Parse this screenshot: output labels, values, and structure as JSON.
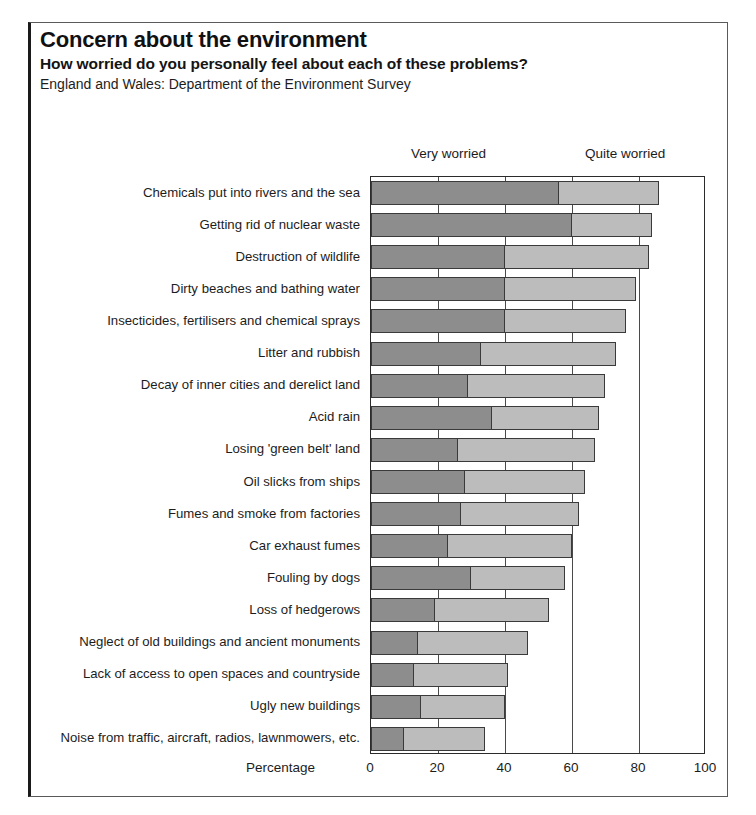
{
  "header": {
    "title": "Concern about the environment",
    "subtitle": "How worried do you personally feel about each of these problems?",
    "source": "England and Wales: Department of the Environment Survey"
  },
  "legend": {
    "very": "Very worried",
    "quite": "Quite worried"
  },
  "axis": {
    "x_title": "Percentage",
    "ticks": [
      "0",
      "20",
      "40",
      "60",
      "80",
      "100"
    ]
  },
  "colors": {
    "very_worried": "#8d8d8d",
    "quite_worried": "#bcbcbc",
    "outline": "#3a3a3a",
    "text": "#1c1c1c"
  },
  "chart_data": {
    "type": "bar",
    "orientation": "horizontal",
    "stacked": true,
    "title": "Concern about the environment",
    "subtitle": "How worried do you personally feel about each of these problems?",
    "source": "England and Wales: Department of the Environment Survey",
    "xlabel": "Percentage",
    "ylabel": "",
    "xlim": [
      0,
      100
    ],
    "xticks": [
      0,
      20,
      40,
      60,
      80,
      100
    ],
    "grid": true,
    "legend_position": "top",
    "categories": [
      "Chemicals put into rivers and the sea",
      "Getting rid of nuclear waste",
      "Destruction of wildlife",
      "Dirty beaches and bathing water",
      "Insecticides, fertilisers and chemical sprays",
      "Litter and rubbish",
      "Decay of inner cities and derelict land",
      "Acid rain",
      "Losing 'green belt' land",
      "Oil slicks from ships",
      "Fumes and smoke from factories",
      "Car exhaust fumes",
      "Fouling by dogs",
      "Loss of hedgerows",
      "Neglect of old buildings and ancient monuments",
      "Lack of access to open spaces and countryside",
      "Ugly new buildings",
      "Noise from traffic, aircraft, radios, lawnmowers, etc."
    ],
    "series": [
      {
        "name": "Very worried",
        "values": [
          56,
          60,
          40,
          40,
          40,
          33,
          29,
          36,
          26,
          28,
          27,
          23,
          30,
          19,
          14,
          13,
          15,
          10
        ]
      },
      {
        "name": "Quite worried",
        "values": [
          30,
          24,
          43,
          39,
          36,
          40,
          41,
          32,
          41,
          36,
          35,
          37,
          28,
          34,
          33,
          28,
          25,
          24
        ]
      }
    ],
    "totals": [
      86,
      84,
      83,
      79,
      76,
      73,
      70,
      68,
      67,
      64,
      62,
      60,
      58,
      53,
      47,
      41,
      40,
      34
    ]
  }
}
